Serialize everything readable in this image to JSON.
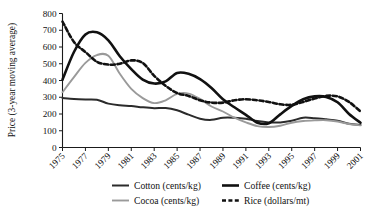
{
  "chart_data": {
    "type": "line",
    "title": "",
    "xlabel": "",
    "ylabel": "Price (3-year moving average)",
    "ylim": [
      0,
      800
    ],
    "xlim": [
      1975,
      2001
    ],
    "grid": false,
    "legend_position": "bottom",
    "ytick_labels": [
      "0",
      "100",
      "200",
      "300",
      "400",
      "500",
      "600",
      "700",
      "800"
    ],
    "yticks": [
      0,
      100,
      200,
      300,
      400,
      500,
      600,
      700,
      800
    ],
    "xtick_labels": [
      "1975",
      "1977",
      "1979",
      "1981",
      "1983",
      "1985",
      "1987",
      "1989",
      "1991",
      "1993",
      "1995",
      "1997",
      "1999",
      "2001"
    ],
    "xticks": [
      1975,
      1977,
      1979,
      1981,
      1983,
      1985,
      1987,
      1989,
      1991,
      1993,
      1995,
      1997,
      1999,
      2001
    ],
    "x": [
      1975,
      1976,
      1977,
      1978,
      1979,
      1980,
      1981,
      1982,
      1983,
      1984,
      1985,
      1986,
      1987,
      1988,
      1989,
      1990,
      1991,
      1992,
      1993,
      1994,
      1995,
      1996,
      1997,
      1998,
      1999,
      2000,
      2001
    ],
    "series": [
      {
        "name": "Cotton (cents/kg)",
        "key": "cotton",
        "style": "solid",
        "color": "#2b2b2b",
        "width": 2.0,
        "values": [
          295,
          290,
          287,
          285,
          262,
          252,
          248,
          240,
          235,
          236,
          222,
          196,
          172,
          165,
          178,
          178,
          172,
          158,
          150,
          150,
          160,
          178,
          175,
          168,
          160,
          142,
          135
        ]
      },
      {
        "name": "Cocoa (cents/kg)",
        "key": "cocoa",
        "style": "solid",
        "color": "#9a9a9a",
        "width": 1.9,
        "values": [
          330,
          420,
          505,
          552,
          548,
          440,
          350,
          295,
          265,
          282,
          320,
          322,
          290,
          245,
          215,
          178,
          150,
          128,
          122,
          130,
          148,
          158,
          162,
          163,
          155,
          140,
          132
        ]
      },
      {
        "name": "Coffee (cents/kg)",
        "key": "coffee",
        "style": "solid",
        "color": "#111111",
        "width": 2.6,
        "values": [
          405,
          570,
          675,
          688,
          640,
          545,
          468,
          405,
          382,
          395,
          445,
          440,
          408,
          355,
          288,
          240,
          195,
          148,
          145,
          198,
          248,
          288,
          305,
          302,
          270,
          200,
          148
        ]
      },
      {
        "name": "Rice (dollars/mt)",
        "key": "rice",
        "style": "dashed",
        "color": "#111111",
        "width": 2.6,
        "values": [
          752,
          630,
          570,
          512,
          495,
          500,
          520,
          505,
          428,
          368,
          325,
          308,
          282,
          268,
          268,
          282,
          288,
          282,
          272,
          258,
          255,
          272,
          292,
          308,
          305,
          272,
          215
        ]
      }
    ],
    "legend": [
      {
        "label": "Cotton (cents/kg)",
        "key": "cotton",
        "style": "solid",
        "color": "#2b2b2b",
        "width": 2.0
      },
      {
        "label": "Coffee (cents/kg)",
        "key": "coffee",
        "style": "solid",
        "color": "#111111",
        "width": 2.6
      },
      {
        "label": "Cocoa (cents/kg)",
        "key": "cocoa",
        "style": "solid",
        "color": "#9a9a9a",
        "width": 1.9
      },
      {
        "label": "Rice (dollars/mt)",
        "key": "rice",
        "style": "dashed",
        "color": "#111111",
        "width": 2.6
      }
    ]
  }
}
